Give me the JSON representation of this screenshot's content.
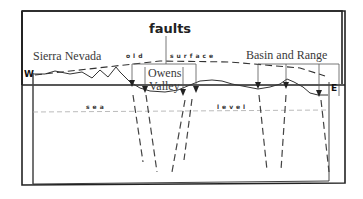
{
  "diagram": {
    "labels": {
      "faults": "faults",
      "sierra_nevada": "Sierra Nevada",
      "old": "old",
      "surface": "surface",
      "basin_and_range": "Basin and Range",
      "owens_valley_line1": "Owens",
      "owens_valley_line2": "Valley",
      "west": "W",
      "east": "E",
      "sea": "sea",
      "level": "level"
    },
    "colors": {
      "line": "#2a2a2a",
      "background": "#ffffff",
      "text": "#3a3a3a"
    }
  }
}
